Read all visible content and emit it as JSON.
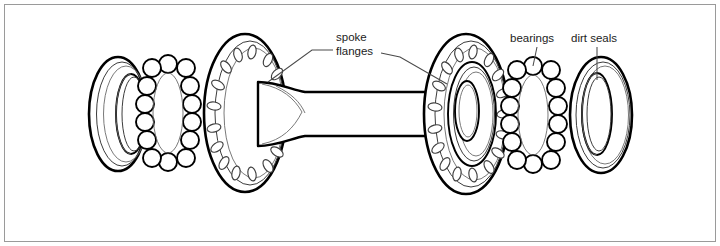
{
  "figure": {
    "background_color": "#ffffff",
    "border_color": "#9a9a9a",
    "line_color": "#000000",
    "text_color": "#1c1c1c"
  },
  "callouts": [
    {
      "id": "spoke-flanges",
      "line1": "spoke",
      "line2": "flanges",
      "text_x": 336,
      "text_y": 41
    },
    {
      "id": "bearings",
      "line1": "bearings",
      "line2": "",
      "text_x": 510,
      "text_y": 42
    },
    {
      "id": "dirt-seals",
      "line1": "dirt seals",
      "line2": "",
      "text_x": 571,
      "text_y": 42
    }
  ],
  "parts": [
    {
      "id": "dirt-seal-left",
      "label": "dirt seal (left)",
      "cx": 118,
      "cy": 114
    },
    {
      "id": "bearing-left",
      "label": "ball bearing ring (left)",
      "cx": 168,
      "cy": 113,
      "ball_count": 16
    },
    {
      "id": "flange-left",
      "label": "spoke flange (left)",
      "cx": 245,
      "cy": 113,
      "spoke_holes": 16
    },
    {
      "id": "hub-barrel",
      "label": "hub barrel / axle shell",
      "cx": 350,
      "cy": 115
    },
    {
      "id": "flange-right",
      "label": "spoke flange (right)",
      "cx": 466,
      "cy": 114,
      "spoke_holes": 16
    },
    {
      "id": "bearing-right",
      "label": "ball bearing ring (right)",
      "cx": 533,
      "cy": 115,
      "ball_count": 16
    },
    {
      "id": "dirt-seal-right",
      "label": "dirt seal (right)",
      "cx": 601,
      "cy": 115
    }
  ]
}
